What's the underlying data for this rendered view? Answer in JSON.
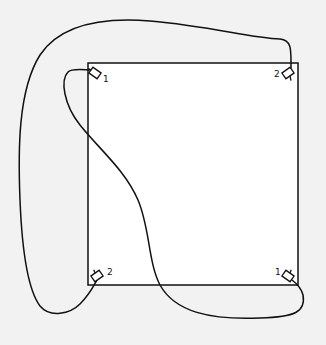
{
  "diagram": {
    "type": "wiring-layout",
    "background_color": "#f2f2f2",
    "stroke_color": "#111111",
    "room": {
      "x": 88,
      "y": 63,
      "width": 210,
      "height": 222,
      "fill": "#ffffff"
    },
    "devices": [
      {
        "id": "top-left",
        "label": "1",
        "x": 95,
        "y": 73,
        "angle": 35,
        "label_x": 103,
        "label_y": 82
      },
      {
        "id": "top-right",
        "label": "2",
        "x": 288,
        "y": 73,
        "angle": -35,
        "label_x": 274,
        "label_y": 77
      },
      {
        "id": "bottom-left",
        "label": "2",
        "x": 97,
        "y": 276,
        "angle": -35,
        "label_x": 107,
        "label_y": 275
      },
      {
        "id": "bottom-right",
        "label": "1",
        "x": 288,
        "y": 276,
        "angle": 35,
        "label_x": 275,
        "label_y": 275
      }
    ],
    "cables": [
      {
        "id": "outer-loop",
        "from": "top-right",
        "to": "bottom-left"
      },
      {
        "id": "inner-curve",
        "from": "top-left",
        "to": "bottom-right"
      }
    ]
  }
}
